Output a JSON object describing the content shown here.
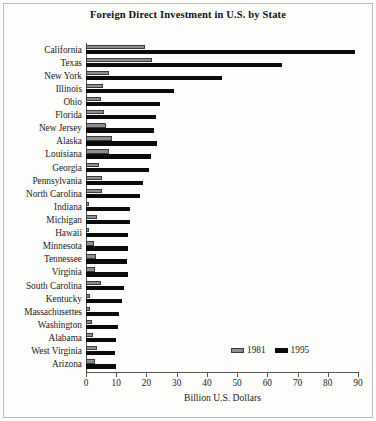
{
  "chart_data": {
    "type": "bar",
    "orientation": "horizontal",
    "title": "Foreign Direct Investment in U.S. by State",
    "xlabel": "Billion U.S. Dollars",
    "ylabel": "",
    "xlim": [
      0,
      90
    ],
    "xticks": [
      0,
      10,
      20,
      30,
      40,
      50,
      60,
      70,
      80,
      90
    ],
    "grid": false,
    "legend_position": "bottom-right",
    "categories": [
      "California",
      "Texas",
      "New York",
      "Illinois",
      "Ohio",
      "Florida",
      "New Jersey",
      "Alaska",
      "Louisiana",
      "Georgia",
      "Pennsylvania",
      "North Carolina",
      "Indiana",
      "Michigan",
      "Hawaii",
      "Minnesota",
      "Tennessee",
      "Virginia",
      "South Carolina",
      "Kentucky",
      "Massachusettes",
      "Washington",
      "Alabama",
      "West Virginia",
      "Arizona"
    ],
    "series": [
      {
        "name": "1981",
        "color": "#8e8e8e",
        "values": [
          19.5,
          22.0,
          7.5,
          5.5,
          4.8,
          6.0,
          6.5,
          8.5,
          7.5,
          4.2,
          5.2,
          5.2,
          1.0,
          3.8,
          1.0,
          2.8,
          3.2,
          3.0,
          5.0,
          1.2,
          1.2,
          2.0,
          2.2,
          3.5,
          3.0
        ]
      },
      {
        "name": "1995",
        "color": "#0b0b0b",
        "values": [
          89.0,
          65.0,
          45.0,
          29.0,
          24.5,
          23.0,
          22.5,
          23.5,
          21.5,
          21.0,
          19.0,
          18.0,
          14.5,
          14.5,
          14.0,
          13.8,
          13.5,
          13.8,
          12.5,
          11.8,
          11.0,
          10.5,
          10.0,
          9.5,
          10.0
        ]
      }
    ]
  },
  "legend": {
    "items": [
      {
        "label": "1981",
        "swatch": "gray-swatch"
      },
      {
        "label": "1995",
        "swatch": "black-swatch"
      }
    ]
  }
}
